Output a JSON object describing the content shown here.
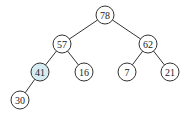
{
  "diagram": {
    "type": "binary-tree",
    "colors": {
      "default_fill": "#ffffff",
      "highlight_fill": "#d6ecf3",
      "stroke": "#333333"
    },
    "nodes": [
      {
        "id": "n78",
        "label": "78",
        "x": 105,
        "y": 15,
        "highlight": false
      },
      {
        "id": "n57",
        "label": "57",
        "x": 62,
        "y": 44,
        "highlight": false
      },
      {
        "id": "n62",
        "label": "62",
        "x": 148,
        "y": 44,
        "highlight": false
      },
      {
        "id": "n41",
        "label": "41",
        "x": 40,
        "y": 72,
        "highlight": true
      },
      {
        "id": "n16",
        "label": "16",
        "x": 84,
        "y": 72,
        "highlight": false
      },
      {
        "id": "n7",
        "label": "7",
        "x": 127,
        "y": 72,
        "highlight": false
      },
      {
        "id": "n21",
        "label": "21",
        "x": 170,
        "y": 72,
        "highlight": false
      },
      {
        "id": "n30",
        "label": "30",
        "x": 20,
        "y": 100,
        "highlight": false
      }
    ],
    "edges": [
      [
        "n78",
        "n57"
      ],
      [
        "n78",
        "n62"
      ],
      [
        "n57",
        "n41"
      ],
      [
        "n57",
        "n16"
      ],
      [
        "n62",
        "n7"
      ],
      [
        "n62",
        "n21"
      ],
      [
        "n41",
        "n30"
      ]
    ]
  }
}
